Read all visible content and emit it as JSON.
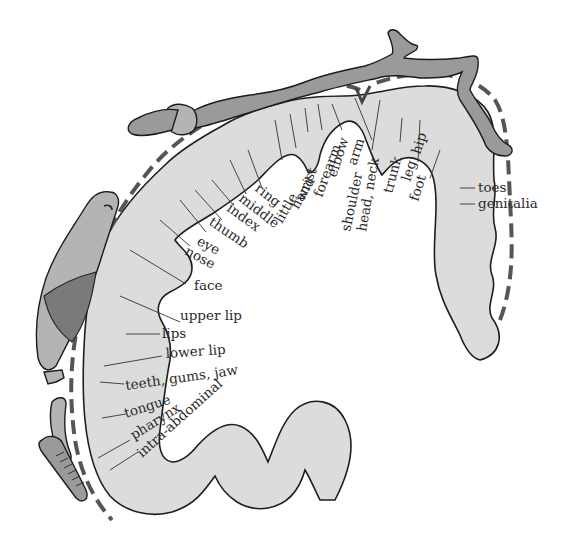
{
  "figure": {
    "labels": {
      "toes": "toes",
      "genitalia": "genitalia",
      "foot": "foot",
      "leg": "leg",
      "hip": "hip",
      "trunk": "trunk",
      "head_neck": "head, neck",
      "shoulder": "shoulder",
      "arm": "arm",
      "elbow": "elbow",
      "forearm": "forearm",
      "wrist": "wrist",
      "hand": "hand",
      "little": "little",
      "ring": "ring",
      "middle": "middle",
      "index": "index",
      "thumb": "thumb",
      "eye": "eye",
      "nose": "nose",
      "face": "face",
      "upper_lip": "upper lip",
      "lips": "lips",
      "lower_lip": "lower lip",
      "teeth_gums_jaw": "teeth, gums, jaw",
      "tongue": "tongue",
      "pharynx": "pharynx",
      "intra_abdominal": "intra-abdominal"
    },
    "colors": {
      "cortex_fill": "#dcdcdc",
      "body_fill": "#9a9a9a",
      "outline": "#1e1e1e",
      "dashed_border": "#555555"
    }
  }
}
